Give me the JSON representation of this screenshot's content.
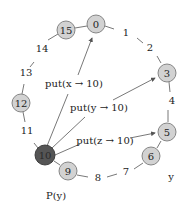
{
  "colors": {
    "node_fill": "#d2d2d2",
    "node_stroke": "#7a7a7a",
    "active_fill": "#555555",
    "active_text": "#2a2a2a",
    "edge": "#555555"
  },
  "ring": {
    "nodes": [
      {
        "id": "15",
        "x": 66,
        "y": 30
      },
      {
        "id": "0",
        "x": 96,
        "y": 24
      },
      {
        "id": "3",
        "x": 167,
        "y": 73
      },
      {
        "id": "5",
        "x": 167,
        "y": 132
      },
      {
        "id": "6",
        "x": 151,
        "y": 156
      },
      {
        "id": "9",
        "x": 68,
        "y": 171
      },
      {
        "id": "10",
        "x": 45,
        "y": 155,
        "active": true
      },
      {
        "id": "12",
        "x": 21,
        "y": 103
      }
    ],
    "position_labels": [
      {
        "text": "1",
        "x": 126,
        "y": 33
      },
      {
        "text": "2",
        "x": 150,
        "y": 48
      },
      {
        "text": "4",
        "x": 172,
        "y": 101
      },
      {
        "text": "7",
        "x": 126,
        "y": 172
      },
      {
        "text": "8",
        "x": 98,
        "y": 178
      },
      {
        "text": "11",
        "x": 27,
        "y": 131
      },
      {
        "text": "13",
        "x": 26,
        "y": 73
      },
      {
        "text": "14",
        "x": 42,
        "y": 49
      }
    ]
  },
  "operations": [
    {
      "label": "put(x → 10)",
      "x": 74,
      "y": 84,
      "target": "0"
    },
    {
      "label": "put(y → 10)",
      "x": 99,
      "y": 108,
      "target": "3"
    },
    {
      "label": "put(z → 10)",
      "x": 105,
      "y": 141,
      "target": "5"
    }
  ],
  "annotations": {
    "py_label": "P(y)",
    "y_label": "y"
  },
  "node_labels": {
    "n15": "15",
    "n0": "0",
    "n3": "3",
    "n5": "5",
    "n6": "6",
    "n9": "9",
    "n10": "10",
    "n12": "12"
  }
}
